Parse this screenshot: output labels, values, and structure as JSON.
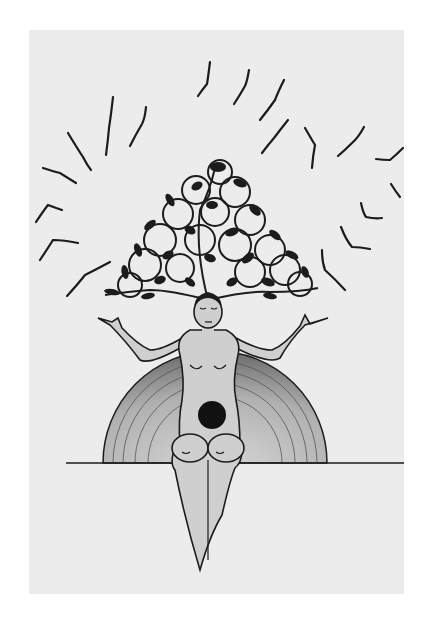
{
  "artwork": {
    "subject": "Seated woman with a tree of curling vines and leaves growing from her head, arms raised, birds circling above, half sun behind her on the horizon, dark circle with crescent moon on her belly",
    "medium": "ink and pencil drawing on paper",
    "colors": {
      "background": "#ffffff",
      "paper": "#ececec",
      "ink": "#1c1c1c",
      "skin": "#cfcfcf",
      "sun_shade": "#9a9a9a"
    },
    "elements": {
      "birds_count": 17,
      "horizon": "horizontal line across lower third",
      "sun": "semicircle behind figure with radial hatching",
      "belly_symbol": "black disc with crescent"
    }
  }
}
